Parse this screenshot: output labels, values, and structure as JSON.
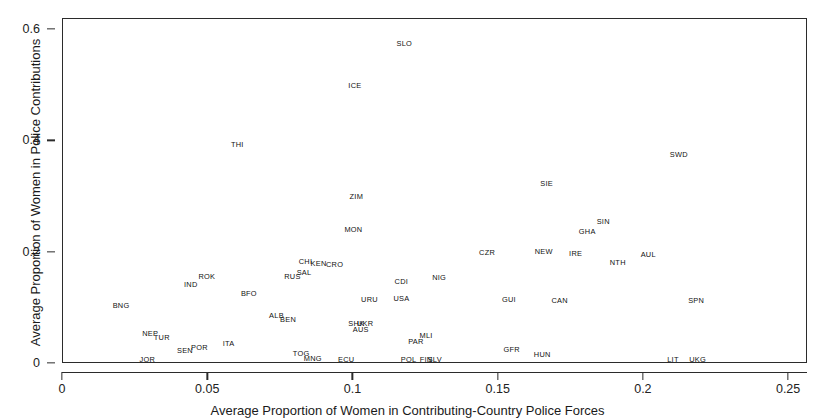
{
  "chart_data": {
    "type": "scatter",
    "title": "",
    "xlabel": "Average Proportion of Women in Contributing-Country Police Forces",
    "ylabel": "Average Proportion of Women in Police Contributions",
    "xlim": [
      0,
      0.2565
    ],
    "ylim": [
      0,
      0.6195
    ],
    "xticks": [
      0,
      0.05,
      0.1,
      0.15,
      0.2,
      0.25
    ],
    "xticklabels": [
      "0",
      "0.05",
      "0.1",
      "0.15",
      "0.2",
      "0.25"
    ],
    "yticks": [
      0,
      0.2,
      0.4,
      0.6
    ],
    "yticklabels": [
      "0",
      "0.2",
      "0.4",
      "0.6"
    ],
    "grid": false,
    "legend": null,
    "marker_style": "text-label",
    "points": [
      {
        "label": "SLO",
        "x": 0.1175,
        "y": 0.5745
      },
      {
        "label": "ICE",
        "x": 0.1005,
        "y": 0.4995
      },
      {
        "label": "THI",
        "x": 0.06,
        "y": 0.394
      },
      {
        "label": "SWD",
        "x": 0.212,
        "y": 0.376
      },
      {
        "label": "SIE",
        "x": 0.1665,
        "y": 0.324
      },
      {
        "label": "ZIM",
        "x": 0.101,
        "y": 0.3
      },
      {
        "label": "SIN",
        "x": 0.186,
        "y": 0.255
      },
      {
        "label": "MON",
        "x": 0.1,
        "y": 0.241
      },
      {
        "label": "GHA",
        "x": 0.1805,
        "y": 0.237
      },
      {
        "label": "NEW",
        "x": 0.1655,
        "y": 0.201
      },
      {
        "label": "IRE",
        "x": 0.1765,
        "y": 0.1975
      },
      {
        "label": "AUL",
        "x": 0.2015,
        "y": 0.196
      },
      {
        "label": "CZR",
        "x": 0.146,
        "y": 0.1985
      },
      {
        "label": "NTH",
        "x": 0.191,
        "y": 0.1815
      },
      {
        "label": "CHI",
        "x": 0.0835,
        "y": 0.183
      },
      {
        "label": "KEN",
        "x": 0.088,
        "y": 0.179
      },
      {
        "label": "CRO",
        "x": 0.0935,
        "y": 0.1785
      },
      {
        "label": "SAL",
        "x": 0.083,
        "y": 0.1635
      },
      {
        "label": "RUS",
        "x": 0.079,
        "y": 0.1565
      },
      {
        "label": "ROK",
        "x": 0.0495,
        "y": 0.1555
      },
      {
        "label": "NIG",
        "x": 0.1295,
        "y": 0.1545
      },
      {
        "label": "CDI",
        "x": 0.1165,
        "y": 0.148
      },
      {
        "label": "IND",
        "x": 0.044,
        "y": 0.141
      },
      {
        "label": "BFO",
        "x": 0.064,
        "y": 0.125
      },
      {
        "label": "USA",
        "x": 0.1165,
        "y": 0.1165
      },
      {
        "label": "URU",
        "x": 0.1055,
        "y": 0.1155
      },
      {
        "label": "GUI",
        "x": 0.1535,
        "y": 0.1155
      },
      {
        "label": "CAN",
        "x": 0.171,
        "y": 0.113
      },
      {
        "label": "SPN",
        "x": 0.218,
        "y": 0.1125
      },
      {
        "label": "BNG",
        "x": 0.02,
        "y": 0.1045
      },
      {
        "label": "ALB",
        "x": 0.0735,
        "y": 0.087
      },
      {
        "label": "BEN",
        "x": 0.0775,
        "y": 0.079
      },
      {
        "label": "UKR",
        "x": 0.104,
        "y": 0.072
      },
      {
        "label": "SHK",
        "x": 0.101,
        "y": 0.0715
      },
      {
        "label": "AUS",
        "x": 0.1025,
        "y": 0.0615
      },
      {
        "label": "NEP",
        "x": 0.03,
        "y": 0.0545
      },
      {
        "label": "TUR",
        "x": 0.034,
        "y": 0.047
      },
      {
        "label": "MLI",
        "x": 0.125,
        "y": 0.0505
      },
      {
        "label": "PAR",
        "x": 0.1215,
        "y": 0.04
      },
      {
        "label": "ITA",
        "x": 0.057,
        "y": 0.0355
      },
      {
        "label": "POR",
        "x": 0.047,
        "y": 0.0285
      },
      {
        "label": "SEN",
        "x": 0.042,
        "y": 0.0225
      },
      {
        "label": "GFR",
        "x": 0.1545,
        "y": 0.025
      },
      {
        "label": "HUN",
        "x": 0.165,
        "y": 0.0165
      },
      {
        "label": "TOG",
        "x": 0.082,
        "y": 0.018
      },
      {
        "label": "MNG",
        "x": 0.086,
        "y": 0.0095
      },
      {
        "label": "JOR",
        "x": 0.029,
        "y": 0.0065
      },
      {
        "label": "ECU",
        "x": 0.0975,
        "y": 0.008
      },
      {
        "label": "POL",
        "x": 0.119,
        "y": 0.0075
      },
      {
        "label": "FIN",
        "x": 0.125,
        "y": 0.0075
      },
      {
        "label": "SLV",
        "x": 0.128,
        "y": 0.0075
      },
      {
        "label": "LIT",
        "x": 0.21,
        "y": 0.007
      },
      {
        "label": "UKG",
        "x": 0.2185,
        "y": 0.007
      }
    ]
  }
}
